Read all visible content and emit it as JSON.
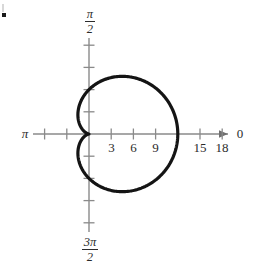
{
  "figure": {
    "problem_marker": "•",
    "background_color": "#ffffff",
    "axis_color": "#8a8a8a",
    "curve_color": "#141414",
    "text_color": "#2b2b2b"
  },
  "axes": {
    "origin_px": {
      "x": 89,
      "y": 134
    },
    "px_per_unit": 7.4,
    "horizontal": {
      "arrow_direction": "right",
      "left_end_label": "π",
      "right_end_label": "0",
      "tick_labels": [
        "3",
        "6",
        "9",
        "15",
        "18"
      ],
      "tick_values": [
        3,
        6,
        9,
        15,
        18
      ],
      "unlabeled_tick_values": [
        12,
        -3,
        -6
      ],
      "label_offset_y": 14
    },
    "vertical": {
      "top_label_numerator": "π",
      "top_label_denominator": "2",
      "bottom_label_numerator": "3π",
      "bottom_label_denominator": "2",
      "tick_values_up": [
        3,
        6,
        9,
        12
      ],
      "tick_values_down": [
        3,
        6,
        9,
        12
      ]
    }
  },
  "chart_data": {
    "type": "line",
    "title": "",
    "subtitle": "",
    "coordinate_system": "polar",
    "curve_name": "cardioid",
    "equation": "r = 6(1 + cos θ)",
    "xlabel": "0",
    "ylabel": "π/2",
    "grid": false,
    "legend": null,
    "xlim": [
      -9,
      21
    ],
    "ylim": [
      -15,
      15
    ],
    "axis_tick_labels_x": [
      "π",
      "3",
      "6",
      "9",
      "15",
      "18",
      "0"
    ],
    "axis_tick_labels_y": [
      "π/2",
      "3π/2"
    ],
    "annotations": [
      {
        "text": "cusp at pole",
        "theta_deg": 180,
        "r": 0
      },
      {
        "text": "maximum radius",
        "theta_deg": 0,
        "r": 12
      }
    ],
    "series": [
      {
        "name": "r = 6(1 + cos θ)",
        "theta_deg": [
          0,
          15,
          30,
          45,
          60,
          75,
          90,
          105,
          120,
          135,
          150,
          165,
          180,
          195,
          210,
          225,
          240,
          255,
          270,
          285,
          300,
          315,
          330,
          345,
          360
        ],
        "r": [
          12.0,
          11.8,
          11.2,
          10.24,
          9.0,
          7.55,
          6.0,
          4.45,
          3.0,
          1.76,
          0.8,
          0.2,
          0.0,
          0.2,
          0.8,
          1.76,
          3.0,
          4.45,
          6.0,
          7.55,
          9.0,
          10.24,
          11.2,
          11.8,
          12.0
        ]
      }
    ],
    "key_points": [
      {
        "label": "theta=0",
        "theta_deg": 0,
        "r": 12
      },
      {
        "label": "theta=90",
        "theta_deg": 90,
        "r": 6
      },
      {
        "label": "theta=180",
        "theta_deg": 180,
        "r": 0
      },
      {
        "label": "theta=270",
        "theta_deg": 270,
        "r": 6
      }
    ]
  }
}
